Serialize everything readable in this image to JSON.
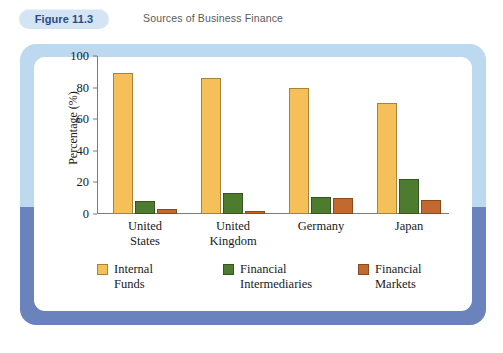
{
  "header": {
    "badge_label": "Figure 11.3",
    "title": "Sources of Business Finance"
  },
  "colors": {
    "internal_funds": "#f5c05a",
    "financial_intermediaries": "#4e7c2e",
    "financial_markets": "#c1692f",
    "frame_top": "#bcd9f0",
    "frame_bottom": "#6b83bc",
    "badge_background": "#d3e4f4",
    "badge_text": "#2b4a86"
  },
  "chart_data": {
    "type": "bar",
    "title": "Sources of Business Finance",
    "xlabel": "",
    "ylabel": "Percentage (%)",
    "ylim": [
      0,
      100
    ],
    "yticks": [
      0,
      20,
      40,
      60,
      80,
      100
    ],
    "ytick_labels": [
      "0",
      "20",
      "40",
      "60",
      "80",
      "100"
    ],
    "grid": false,
    "legend_position": "bottom",
    "categories": [
      "United\nStates",
      "United\nKingdom",
      "Germany",
      "Japan"
    ],
    "series": [
      {
        "name": "Internal\nFunds",
        "legend_label": "Internal\nFunds",
        "color": "#f5c05a",
        "values": [
          89,
          86,
          80,
          70
        ]
      },
      {
        "name": "Financial\nIntermediaries",
        "legend_label": "Financial\nIntermediaries",
        "color": "#4e7c2e",
        "values": [
          8,
          13,
          11,
          22
        ]
      },
      {
        "name": "Financial\nMarkets",
        "legend_label": "Financial\nMarkets",
        "color": "#c1692f",
        "values": [
          3,
          2,
          10,
          9
        ]
      }
    ]
  }
}
